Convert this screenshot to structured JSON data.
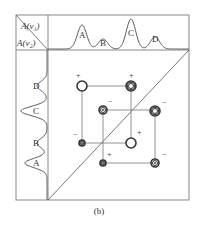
{
  "figure": {
    "caption": "(b)",
    "corner_labels": {
      "top": "A(ν₁)",
      "bottom": "A(ν₂)"
    },
    "frame": {
      "left": 16,
      "top": 15,
      "right": 189,
      "bottom": 200,
      "div_x": 48,
      "div_y": 50
    },
    "top_spectrum": {
      "axis": "A(ν₁)",
      "peaks": [
        {
          "label": "A",
          "x": 82,
          "height": 24
        },
        {
          "label": "B",
          "x": 103,
          "height": 10
        },
        {
          "label": "C",
          "x": 131,
          "height": 30
        },
        {
          "label": "D",
          "x": 155,
          "height": 12
        }
      ]
    },
    "left_spectrum": {
      "axis": "A(ν₂)",
      "peaks": [
        {
          "label": "D",
          "y": 86,
          "width": 10
        },
        {
          "label": "C",
          "y": 111,
          "width": 26
        },
        {
          "label": "B",
          "y": 143,
          "width": 10
        },
        {
          "label": "A",
          "y": 163,
          "width": 22
        }
      ]
    },
    "cross_peaks": [
      {
        "x": 82,
        "y": 86,
        "rings": 1,
        "radius": 5,
        "sign": "+",
        "sign_dx": -4,
        "sign_dy": -8
      },
      {
        "x": 131,
        "y": 86,
        "rings": 3,
        "radius": 5,
        "sign": "+",
        "sign_dx": 0,
        "sign_dy": -8
      },
      {
        "x": 103,
        "y": 110,
        "rings": 2,
        "radius": 4,
        "sign": "−",
        "sign_dx": 7,
        "sign_dy": -6
      },
      {
        "x": 155,
        "y": 111,
        "rings": 3,
        "radius": 5,
        "sign": "−",
        "sign_dx": 9,
        "sign_dy": -6
      },
      {
        "x": 82,
        "y": 143,
        "rings": 2,
        "radius": 3,
        "sign": "−",
        "sign_dx": -7,
        "sign_dy": -6
      },
      {
        "x": 131,
        "y": 143,
        "rings": 1,
        "radius": 5,
        "sign": "+",
        "sign_dx": 8,
        "sign_dy": -8
      },
      {
        "x": 103,
        "y": 163,
        "rings": 2,
        "radius": 3,
        "sign": "+",
        "sign_dx": 6,
        "sign_dy": -6
      },
      {
        "x": 155,
        "y": 163,
        "rings": 2,
        "radius": 4,
        "sign": "−",
        "sign_dx": 9,
        "sign_dy": -6
      }
    ],
    "grid_lines": {
      "rows": [
        86,
        110,
        143,
        163
      ],
      "cols": [
        82,
        103,
        131,
        155
      ]
    },
    "colors": {
      "line": "#555555",
      "frame": "#888888",
      "text": "#333333"
    }
  }
}
